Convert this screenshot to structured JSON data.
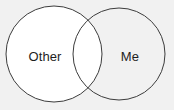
{
  "diagram": {
    "type": "venn-diagram",
    "set_count": 2,
    "background_color": "#f1f1f1",
    "stroke_color": "#3c3c3c",
    "fill_color": "#ffffff",
    "text_color": "#1e1e1e",
    "sets": [
      {
        "id": "left",
        "label": "Other",
        "center_x": 54,
        "center_y": 54,
        "radius": 48,
        "label_x": 45,
        "label_y": 56
      },
      {
        "id": "right",
        "label": "Me",
        "center_x": 119,
        "center_y": 54,
        "radius": 46,
        "label_x": 130,
        "label_y": 56
      }
    ],
    "intersection": {
      "label": "",
      "top_crossing_x": 87,
      "top_crossing_y": 13,
      "bottom_crossing_x": 87,
      "bottom_crossing_y": 96
    }
  }
}
